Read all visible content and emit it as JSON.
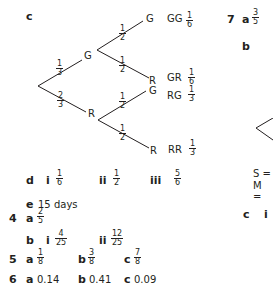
{
  "q3": {
    "part_c": {
      "label": "c",
      "tree": {
        "first": [
          {
            "outcome": "G",
            "prob": {
              "n": "1",
              "d": "3"
            }
          },
          {
            "outcome": "R",
            "prob": {
              "n": "2",
              "d": "3"
            }
          }
        ],
        "second_after_G": [
          {
            "outcome": "G",
            "prob": {
              "n": "1",
              "d": "2"
            }
          },
          {
            "outcome": "R",
            "prob": {
              "n": "1",
              "d": "2"
            }
          }
        ],
        "second_after_R": [
          {
            "outcome": "G",
            "prob": {
              "n": "1",
              "d": "2"
            }
          },
          {
            "outcome": "R",
            "prob": {
              "n": "1",
              "d": "2"
            }
          }
        ],
        "results": [
          {
            "pair": "GG",
            "prob": {
              "n": "1",
              "d": "6"
            }
          },
          {
            "pair": "GR",
            "prob": {
              "n": "1",
              "d": "6"
            }
          },
          {
            "pair": "RG",
            "prob": {
              "n": "1",
              "d": "3"
            }
          },
          {
            "pair": "RR",
            "prob": {
              "n": "1",
              "d": "3"
            }
          }
        ]
      }
    },
    "part_d": {
      "label": "d",
      "items": [
        {
          "label": "i",
          "n": "1",
          "d": "6"
        },
        {
          "label": "ii",
          "n": "1",
          "d": "2"
        },
        {
          "label": "iii",
          "n": "5",
          "d": "6"
        }
      ]
    },
    "part_e": {
      "label": "e",
      "text": "15 days"
    }
  },
  "q4": {
    "number": "4",
    "a": {
      "label": "a",
      "n": "2",
      "d": "5"
    },
    "b": {
      "label": "b",
      "items": [
        {
          "label": "i",
          "n": "4",
          "d": "25"
        },
        {
          "label": "ii",
          "n": "12",
          "d": "25"
        }
      ]
    }
  },
  "q5": {
    "number": "5",
    "items": [
      {
        "label": "a",
        "n": "1",
        "d": "8"
      },
      {
        "label": "b",
        "n": "3",
        "d": "8"
      },
      {
        "label": "c",
        "n": "7",
        "d": "8"
      }
    ]
  },
  "q6": {
    "number": "6",
    "items": [
      {
        "label": "a",
        "value": "0.14"
      },
      {
        "label": "b",
        "value": "0.41"
      },
      {
        "label": "c",
        "value": "0.09"
      }
    ]
  },
  "q7": {
    "number": "7",
    "a": {
      "label": "a",
      "n": "3",
      "d": "5"
    },
    "b": {
      "label": "b"
    },
    "key": [
      "S =",
      "M ="
    ],
    "c": {
      "label": "c",
      "sub": "i"
    }
  }
}
